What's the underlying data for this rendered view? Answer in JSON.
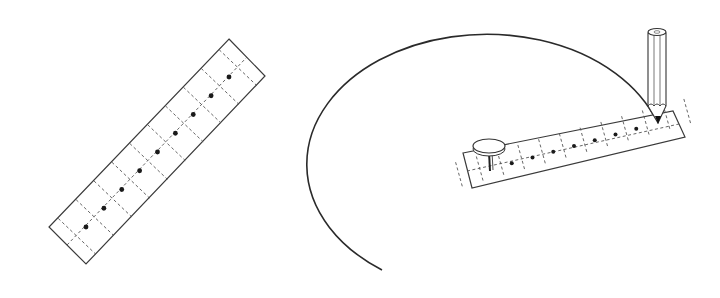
{
  "figure": {
    "colors": {
      "stroke": "#3a3a3a",
      "dash": "#555555",
      "dot": "#1a1a1a",
      "background": "#ffffff"
    }
  },
  "left_strip": {
    "label": "paper strip with marked points",
    "corners": [
      [
        229,
        39
      ],
      [
        265,
        76
      ],
      [
        86,
        264
      ],
      [
        49,
        227
      ]
    ],
    "dot_count": 9,
    "dot_start": [
      86,
      227
    ],
    "dot_end": [
      229,
      77
    ]
  },
  "right_setup": {
    "arc": {
      "center": [
        490,
        158
      ],
      "rx": 180,
      "ry": 130,
      "start": [
        382,
        270
      ],
      "end": [
        657,
        122
      ]
    },
    "strip": {
      "corners": [
        [
          463,
          153
        ],
        [
          673,
          111
        ],
        [
          685,
          137
        ],
        [
          472,
          188
        ]
      ],
      "dot_count": 9
    },
    "thumbtack": {
      "head_center": [
        489,
        146
      ],
      "rx": 16,
      "ry": 8
    },
    "pencil": {
      "top_center": [
        657,
        30
      ],
      "tip": [
        658,
        122
      ]
    }
  }
}
